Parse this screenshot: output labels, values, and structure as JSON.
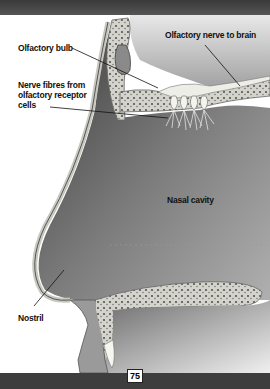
{
  "illustration": {
    "subject": "Cross-section of the human nose showing the olfactory system",
    "labels": {
      "olfactory_bulb": "Olfactory bulb",
      "olfactory_nerve": "Olfactory nerve to brain",
      "nerve_fibres": "Nerve fibres from olfactory receptor cells",
      "nerve_fibres_line1": "Nerve fibres from",
      "nerve_fibres_line2": "olfactory receptor",
      "nerve_fibres_line3": "cells",
      "nasal_cavity": "Nasal cavity",
      "nostril": "Nostril"
    }
  },
  "footer": {
    "page_number": "75"
  },
  "colors": {
    "bar": "#3e3e3e",
    "cavity_dark": "#4a4a4a",
    "bone_light": "#d8d8d0",
    "text": "#111111"
  }
}
